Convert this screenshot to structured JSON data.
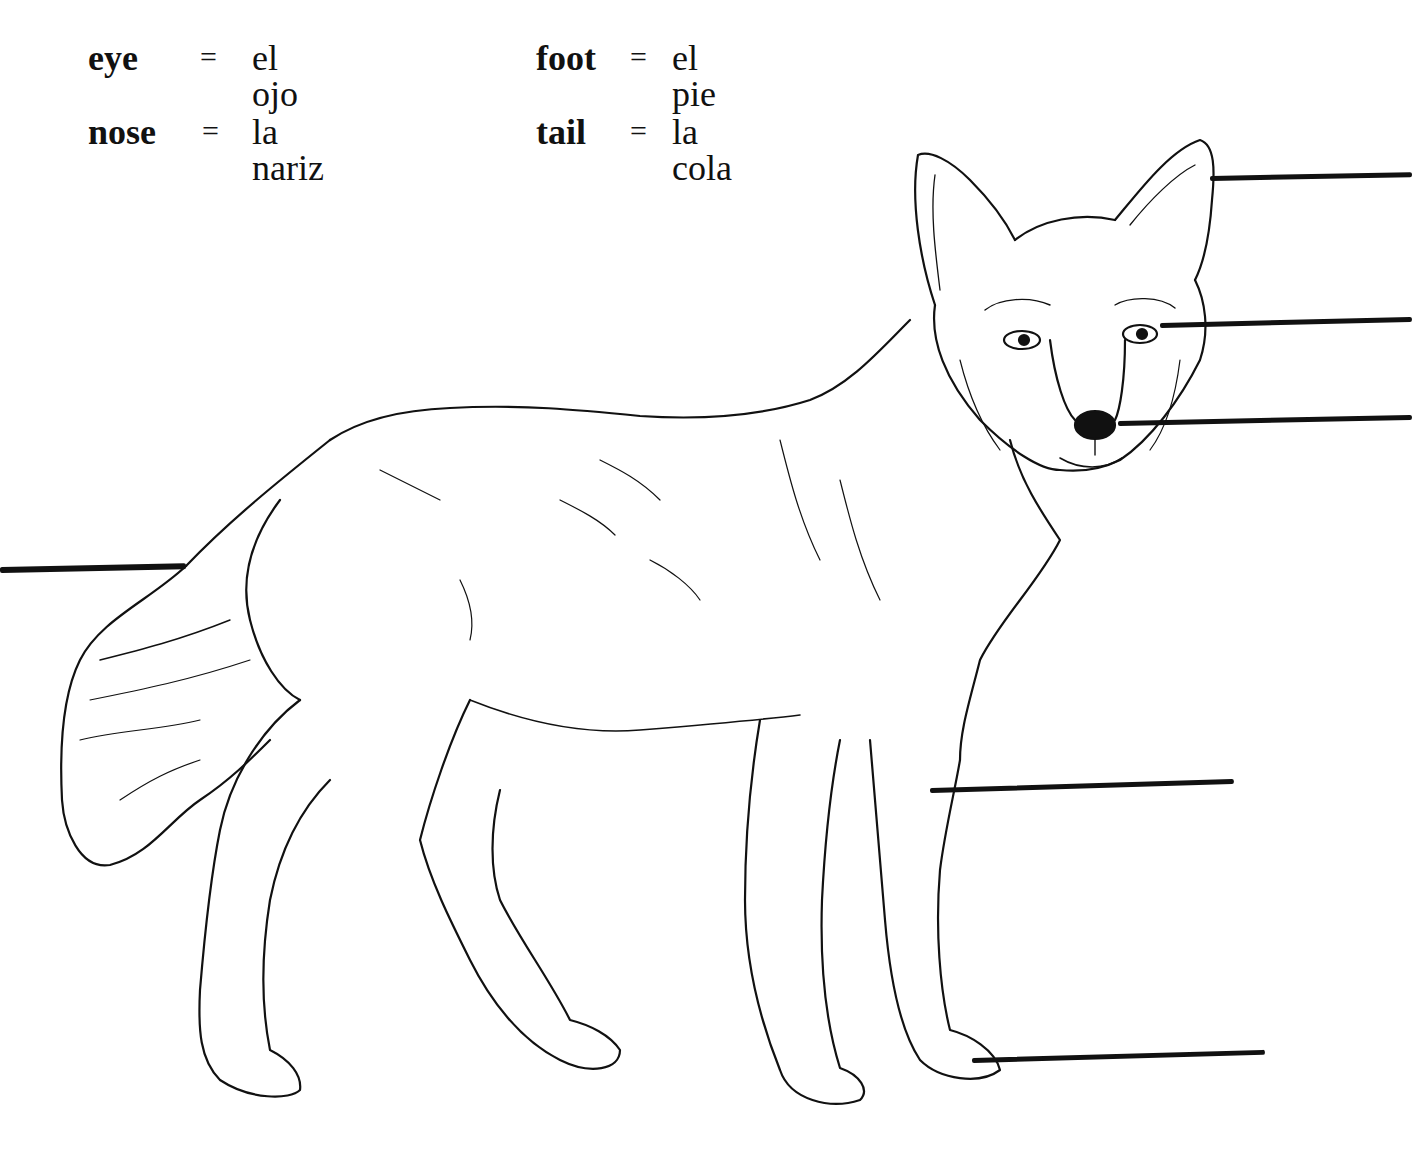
{
  "vocabulary": [
    {
      "term": "eye",
      "equals": "=",
      "translation": "el ojo"
    },
    {
      "term": "nose",
      "equals": "=",
      "translation": "la nariz"
    },
    {
      "term": "foot",
      "equals": "=",
      "translation": "el pie"
    },
    {
      "term": "tail",
      "equals": "=",
      "translation": "la cola"
    }
  ],
  "illustration": {
    "subject": "coyote line drawing",
    "stroke_color": "#111111",
    "background": "#ffffff"
  },
  "label_lines": [
    {
      "target": "ear",
      "x1": 1210,
      "y1": 178,
      "x2": 1412,
      "y2": 174
    },
    {
      "target": "eye",
      "x1": 1160,
      "y1": 326,
      "x2": 1412,
      "y2": 320
    },
    {
      "target": "nose",
      "x1": 1118,
      "y1": 424,
      "x2": 1412,
      "y2": 418
    },
    {
      "target": "tail",
      "x1": 0,
      "y1": 570,
      "x2": 186,
      "y2": 566
    },
    {
      "target": "leg",
      "x1": 930,
      "y1": 792,
      "x2": 1234,
      "y2": 783
    },
    {
      "target": "foot",
      "x1": 972,
      "y1": 1062,
      "x2": 1265,
      "y2": 1054
    }
  ]
}
